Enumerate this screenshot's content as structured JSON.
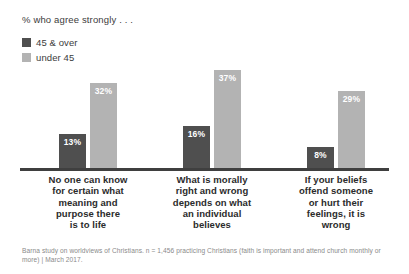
{
  "chart_data": {
    "type": "bar",
    "title": "% who agree strongly . . .",
    "xlabel": "",
    "ylabel": "",
    "ylim": [
      0,
      40
    ],
    "grid": false,
    "legend_position": "top-left",
    "categories": [
      "No one can know for certain what meaning and purpose there is to life",
      "What is morally right and  wrong depends on what an individual believes",
      "If your beliefs offend someone or hurt their feelings, it is wrong"
    ],
    "series": [
      {
        "name": "45 & over",
        "color": "#4f4f4f",
        "values": [
          13,
          16,
          8
        ],
        "labels": [
          "13%",
          "16%",
          "8%"
        ]
      },
      {
        "name": "under 45",
        "color": "#b3b3b3",
        "values": [
          32,
          37,
          29
        ],
        "labels": [
          "32%",
          "37%",
          "29%"
        ]
      }
    ],
    "annotations": [
      "Barna study on worldviews of Christians. n = 1,456 practicing Christians (faith is important and attend church monthly or more) | March 2017."
    ]
  },
  "legend": {
    "items": [
      {
        "label": "45 & over",
        "color": "#4f4f4f"
      },
      {
        "label": "under 45",
        "color": "#b3b3b3"
      }
    ]
  },
  "categories_display": [
    "No one can know\nfor certain what\nmeaning and\npurpose there\nis to life",
    "What is morally\nright and  wrong\ndepends on what\nan individual\nbelieves",
    "If your beliefs\noffend someone\nor hurt their\nfeelings, it is\nwrong"
  ],
  "footnote": "Barna study on worldviews of Christians. n = 1,456 practicing Christians (faith is important and attend church monthly or more) | March 2017.",
  "colors": {
    "dark_series": "#4f4f4f",
    "light_series": "#b3b3b3",
    "baseline": "#3f3f3f",
    "title_text": "#3c3c3c",
    "category_text": "#2b2b2b",
    "footnote_text": "#8a8a8a",
    "background": "#ffffff"
  }
}
